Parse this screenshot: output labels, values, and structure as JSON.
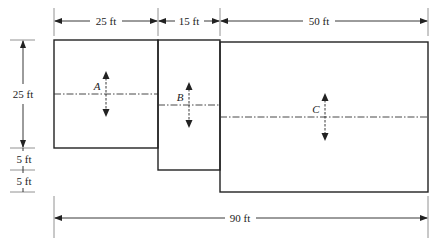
{
  "diagram": {
    "type": "plan-view-strip-footings",
    "colors": {
      "line": "#222222",
      "background": "#ffffff"
    },
    "dimensions": {
      "top": [
        {
          "label": "25 ft",
          "from": 54,
          "to": 158
        },
        {
          "label": "15 ft",
          "from": 158,
          "to": 220
        },
        {
          "label": "50 ft",
          "from": 220,
          "to": 428
        }
      ],
      "left": [
        {
          "label": "25 ft"
        },
        {
          "label": "5 ft"
        },
        {
          "label": "5 ft"
        }
      ],
      "bottom": {
        "label": "90 ft"
      }
    },
    "areas": [
      {
        "id": "A",
        "label": "A",
        "width_ft": 25,
        "height_ft": 25
      },
      {
        "id": "B",
        "label": "B",
        "width_ft": 15,
        "height_ft": 30
      },
      {
        "id": "C",
        "label": "C",
        "width_ft": 50,
        "height_ft": 35
      }
    ]
  }
}
